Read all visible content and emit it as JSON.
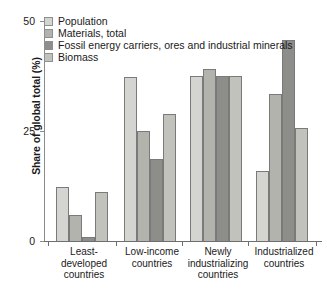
{
  "chart_data": {
    "type": "bar",
    "title": "",
    "xlabel": "",
    "ylabel": "Share of global total (%)",
    "ylim": [
      0,
      50
    ],
    "yticks": [
      0,
      25,
      50
    ],
    "ytick_labels": [
      "0",
      "25",
      "50"
    ],
    "grid": false,
    "legend_position": "top-left",
    "categories": [
      "Least-developed countries",
      "Low-income countries",
      "Newly industrializing countries",
      "Industrialized countries"
    ],
    "category_lines": [
      [
        "Least-",
        "developed",
        "countries"
      ],
      [
        "Low-income",
        "countries"
      ],
      [
        "Newly",
        "industrializing",
        "countries"
      ],
      [
        "Industrialized",
        "countries"
      ]
    ],
    "series": [
      {
        "name": "Population",
        "color": "#d4d4d0",
        "values": [
          12.2,
          37.3,
          37.4,
          16.0
        ]
      },
      {
        "name": "Materials, total",
        "color": "#b3b3ae",
        "values": [
          6.0,
          25.0,
          39.0,
          33.5
        ]
      },
      {
        "name": "Fossil energy carriers, ores and industrial minerals",
        "color": "#8d8d8a",
        "values": [
          0.8,
          18.6,
          37.5,
          45.7
        ]
      },
      {
        "name": "Biomass",
        "color": "#c2c2bd",
        "values": [
          11.2,
          28.8,
          37.5,
          25.7
        ]
      }
    ]
  }
}
